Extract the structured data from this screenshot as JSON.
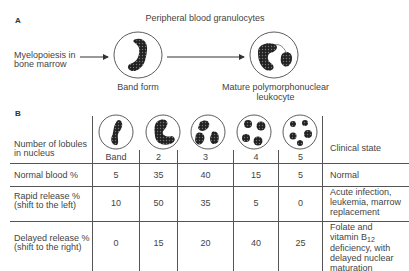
{
  "panel_a": {
    "label": "A",
    "title": "Peripheral blood granulocytes",
    "source_label_line1": "Myelopoiesis in",
    "source_label_line2": "bone marrow",
    "band_label": "Band form",
    "mature_label_line1": "Mature polymorphonuclear",
    "mature_label_line2": "leukocyte"
  },
  "panel_b": {
    "label": "B",
    "row_header_line1": "Number of lobules",
    "row_header_line2": "in nucleus",
    "clinical_header": "Clinical state",
    "columns": [
      "Band",
      "2",
      "3",
      "4",
      "5"
    ],
    "rows": [
      {
        "label_line1": "Normal blood %",
        "label_line2": "",
        "values": [
          "5",
          "35",
          "40",
          "15",
          "5"
        ],
        "clinical_lines": [
          "Normal"
        ]
      },
      {
        "label_line1": "Rapid release %",
        "label_line2": "(shift to the left)",
        "values": [
          "10",
          "50",
          "35",
          "5",
          "0"
        ],
        "clinical_lines": [
          "Acute infection,",
          "leukemia, marrow",
          "replacement"
        ]
      },
      {
        "label_line1": "Delayed release %",
        "label_line2": "(shift to the right)",
        "values": [
          "0",
          "15",
          "20",
          "40",
          "25"
        ],
        "clinical_lines": [
          "Folate and",
          "vitamin B",
          "deficiency, with",
          "delayed nuclear",
          "maturation"
        ],
        "b12_subscript": "12"
      }
    ]
  }
}
